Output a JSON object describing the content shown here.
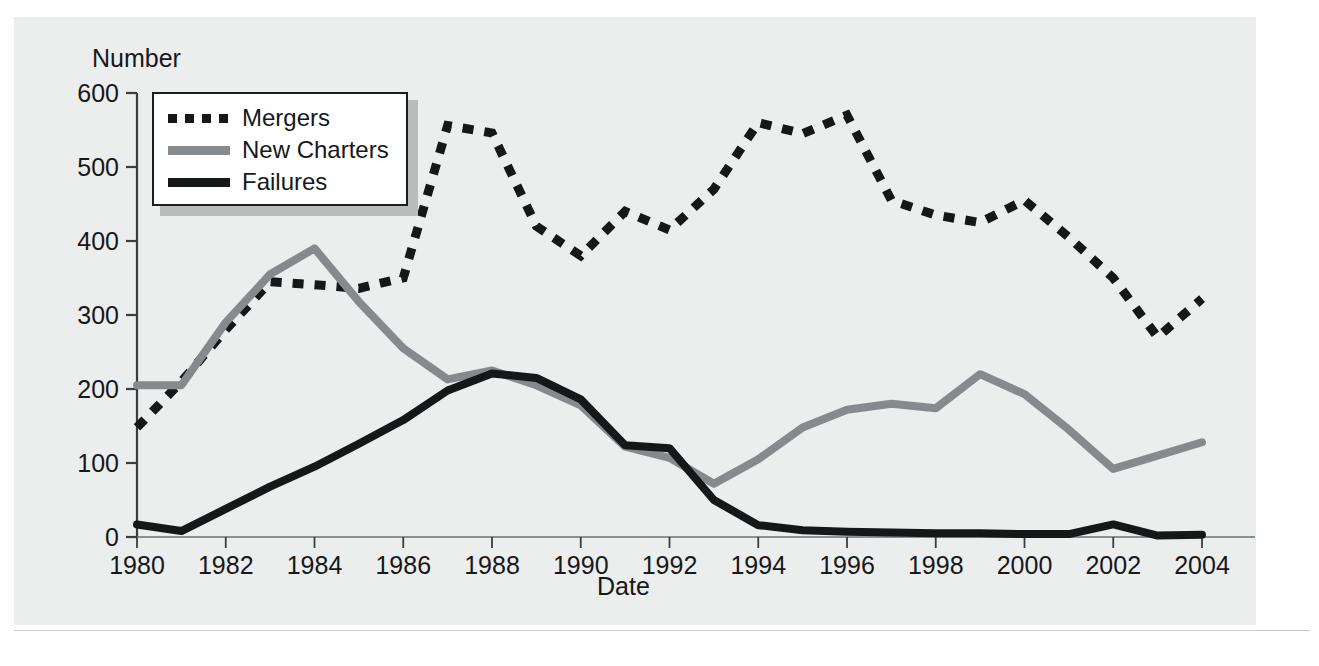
{
  "figure": {
    "background_color": "#eceded",
    "page_color": "#ffffff"
  },
  "axes": {
    "ylabel": "Number",
    "xlabel": "Date",
    "yticks": [
      "0",
      "100",
      "200",
      "300",
      "400",
      "500",
      "600"
    ],
    "xticks": [
      "1980",
      "1982",
      "1984",
      "1986",
      "1988",
      "1990",
      "1992",
      "1994",
      "1996",
      "1998",
      "2000",
      "2002",
      "2004"
    ]
  },
  "legend": {
    "items": [
      {
        "label": "Mergers",
        "style": "dashed-dark",
        "color": "#151719"
      },
      {
        "label": "New Charters",
        "style": "solid-gray",
        "color": "#878a8c"
      },
      {
        "label": "Failures",
        "style": "solid-dark",
        "color": "#151719"
      }
    ]
  },
  "chart_data": {
    "type": "line",
    "title": "",
    "xlabel": "Date",
    "ylabel": "Number",
    "xlim": [
      1980,
      2004
    ],
    "ylim": [
      0,
      600
    ],
    "grid": false,
    "legend_position": "upper-left",
    "xticks": [
      1980,
      1982,
      1984,
      1986,
      1988,
      1990,
      1992,
      1994,
      1996,
      1998,
      2000,
      2002,
      2004
    ],
    "yticks": [
      0,
      100,
      200,
      300,
      400,
      500,
      600
    ],
    "x": [
      1980,
      1981,
      1982,
      1983,
      1984,
      1985,
      1986,
      1987,
      1988,
      1989,
      1990,
      1991,
      1992,
      1993,
      1994,
      1995,
      1996,
      1997,
      1998,
      1999,
      2000,
      2001,
      2002,
      2003,
      2004
    ],
    "series": [
      {
        "name": "Mergers",
        "color": "#151719",
        "linestyle": "dashed",
        "values": [
          148,
          210,
          280,
          345,
          341,
          336,
          350,
          556,
          546,
          420,
          380,
          440,
          415,
          470,
          560,
          545,
          570,
          455,
          435,
          425,
          455,
          405,
          350,
          270,
          322
        ]
      },
      {
        "name": "New Charters",
        "color": "#878a8c",
        "linestyle": "solid",
        "values": [
          205,
          205,
          290,
          355,
          390,
          318,
          255,
          213,
          225,
          205,
          178,
          122,
          107,
          72,
          105,
          148,
          172,
          180,
          174,
          220,
          193,
          145,
          92,
          110,
          128
        ]
      },
      {
        "name": "Failures",
        "color": "#151719",
        "linestyle": "solid",
        "values": [
          17,
          8,
          38,
          68,
          95,
          126,
          158,
          198,
          221,
          215,
          186,
          124,
          120,
          50,
          16,
          9,
          7,
          6,
          5,
          5,
          4,
          4,
          17,
          2,
          3
        ]
      }
    ]
  }
}
